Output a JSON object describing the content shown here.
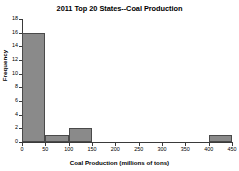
{
  "chart_data": {
    "type": "bar",
    "title": "2011 Top 20 States--Coal Production",
    "xlabel": "Coal Production (millions of tons)",
    "ylabel": "Frequency",
    "categories": [
      "0-50",
      "50-100",
      "100-150",
      "150-200",
      "200-250",
      "250-300",
      "300-350",
      "350-400",
      "400-450"
    ],
    "bin_starts": [
      0,
      50,
      100,
      150,
      200,
      250,
      300,
      350,
      400
    ],
    "bin_width": 50,
    "values": [
      16,
      1,
      2,
      0,
      0,
      0,
      0,
      0,
      1
    ],
    "xlim": [
      0,
      450
    ],
    "ylim": [
      0,
      18
    ],
    "xticks": [
      0,
      50,
      100,
      150,
      200,
      250,
      300,
      350,
      400,
      450
    ],
    "xtick_labels": [
      "0",
      "50",
      "100",
      "150",
      "200",
      "250",
      "300",
      "350",
      "400",
      "450"
    ],
    "yticks": [
      0,
      2,
      4,
      6,
      8,
      10,
      12,
      14,
      16,
      18
    ],
    "ytick_labels": [
      "0",
      "2",
      "4",
      "6",
      "8",
      "10",
      "12",
      "14",
      "16",
      "18"
    ],
    "grid": false,
    "legend": "none",
    "bar_color": "#8a8a8a",
    "bar_edge_color": "#4a4a4a",
    "axis_color": "#3a3a3a",
    "background": "#ffffff"
  }
}
